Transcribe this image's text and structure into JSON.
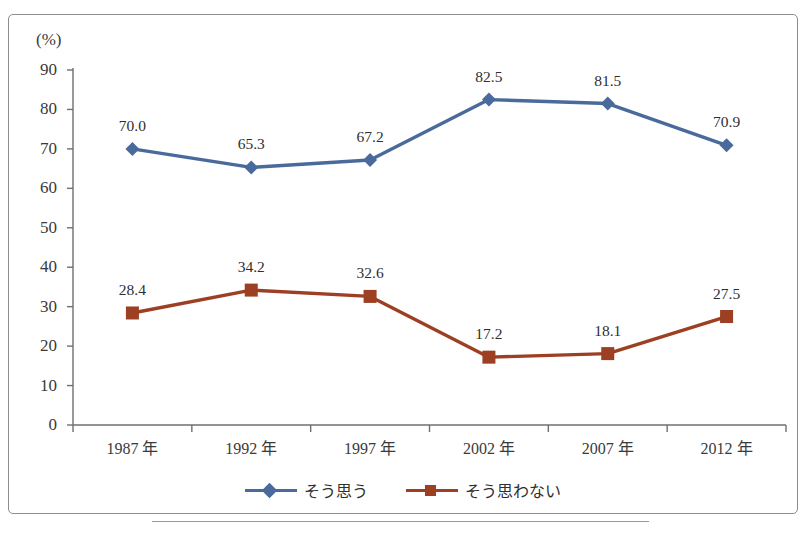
{
  "chart_data": {
    "type": "line",
    "title": "",
    "xlabel": "",
    "ylabel": "(%)",
    "unit_label": "(%)",
    "categories": [
      "1987 年",
      "1992 年",
      "1997 年",
      "2002 年",
      "2007 年",
      "2012 年"
    ],
    "ylim": [
      0,
      90
    ],
    "yticks": [
      0,
      10,
      20,
      30,
      40,
      50,
      60,
      70,
      80,
      90
    ],
    "ytick_labels": [
      "0",
      "10",
      "20",
      "30",
      "40",
      "50",
      "60",
      "70",
      "80",
      "90"
    ],
    "grid": false,
    "legend_position": "bottom-center",
    "series": [
      {
        "name": "そう思う",
        "color": "#4a6a9c",
        "marker": "diamond",
        "values": [
          70.0,
          65.3,
          67.2,
          82.5,
          81.5,
          70.9
        ],
        "labels": [
          "70.0",
          "65.3",
          "67.2",
          "82.5",
          "81.5",
          "70.9"
        ]
      },
      {
        "name": "そう思わない",
        "color": "#9c3f22",
        "marker": "square",
        "values": [
          28.4,
          34.2,
          32.6,
          17.2,
          18.1,
          27.5
        ],
        "labels": [
          "28.4",
          "34.2",
          "32.6",
          "17.2",
          "18.1",
          "27.5"
        ]
      }
    ]
  },
  "legend": {
    "items": [
      {
        "label": "そう思う",
        "color": "#4a6a9c",
        "marker": "diamond"
      },
      {
        "label": "そう思わない",
        "color": "#9c3f22",
        "marker": "square"
      }
    ]
  },
  "footer": {
    "caption": ""
  }
}
